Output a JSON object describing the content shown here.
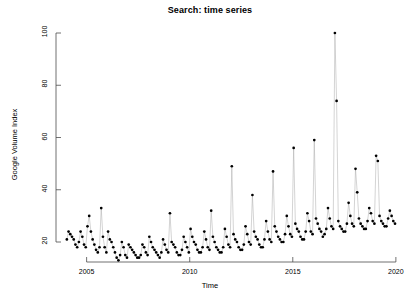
{
  "chart_data": {
    "type": "line",
    "title": "Search: time series",
    "xlabel": "Time",
    "ylabel": "Google Volume Index",
    "grid": false,
    "legend": null,
    "xlim": [
      2004.0,
      2020.0
    ],
    "ylim": [
      11,
      100
    ],
    "yticks": [
      20,
      40,
      60,
      80,
      100
    ],
    "xticks": [
      2005,
      2010,
      2015,
      2020
    ],
    "marker": "filled-circle",
    "marker_color": "#000000",
    "line_color": "#a9a9a9",
    "x": [
      2004.042,
      2004.125,
      2004.208,
      2004.292,
      2004.375,
      2004.458,
      2004.542,
      2004.625,
      2004.708,
      2004.792,
      2004.875,
      2004.958,
      2005.042,
      2005.125,
      2005.208,
      2005.292,
      2005.375,
      2005.458,
      2005.542,
      2005.625,
      2005.708,
      2005.792,
      2005.875,
      2005.958,
      2006.042,
      2006.125,
      2006.208,
      2006.292,
      2006.375,
      2006.458,
      2006.542,
      2006.625,
      2006.708,
      2006.792,
      2006.875,
      2006.958,
      2007.042,
      2007.125,
      2007.208,
      2007.292,
      2007.375,
      2007.458,
      2007.542,
      2007.625,
      2007.708,
      2007.792,
      2007.875,
      2007.958,
      2008.042,
      2008.125,
      2008.208,
      2008.292,
      2008.375,
      2008.458,
      2008.542,
      2008.625,
      2008.708,
      2008.792,
      2008.875,
      2008.958,
      2009.042,
      2009.125,
      2009.208,
      2009.292,
      2009.375,
      2009.458,
      2009.542,
      2009.625,
      2009.708,
      2009.792,
      2009.875,
      2009.958,
      2010.042,
      2010.125,
      2010.208,
      2010.292,
      2010.375,
      2010.458,
      2010.542,
      2010.625,
      2010.708,
      2010.792,
      2010.875,
      2010.958,
      2011.042,
      2011.125,
      2011.208,
      2011.292,
      2011.375,
      2011.458,
      2011.542,
      2011.625,
      2011.708,
      2011.792,
      2011.875,
      2011.958,
      2012.042,
      2012.125,
      2012.208,
      2012.292,
      2012.375,
      2012.458,
      2012.542,
      2012.625,
      2012.708,
      2012.792,
      2012.875,
      2012.958,
      2013.042,
      2013.125,
      2013.208,
      2013.292,
      2013.375,
      2013.458,
      2013.542,
      2013.625,
      2013.708,
      2013.792,
      2013.875,
      2013.958,
      2014.042,
      2014.125,
      2014.208,
      2014.292,
      2014.375,
      2014.458,
      2014.542,
      2014.625,
      2014.708,
      2014.792,
      2014.875,
      2014.958,
      2015.042,
      2015.125,
      2015.208,
      2015.292,
      2015.375,
      2015.458,
      2015.542,
      2015.625,
      2015.708,
      2015.792,
      2015.875,
      2015.958,
      2016.042,
      2016.125,
      2016.208,
      2016.292,
      2016.375,
      2016.458,
      2016.542,
      2016.625,
      2016.708,
      2016.792,
      2016.875,
      2016.958,
      2017.042,
      2017.125,
      2017.208,
      2017.292,
      2017.375,
      2017.458,
      2017.542,
      2017.625,
      2017.708,
      2017.792,
      2017.875,
      2017.958,
      2018.042,
      2018.125,
      2018.208,
      2018.292,
      2018.375,
      2018.458,
      2018.542,
      2018.625,
      2018.708,
      2018.792,
      2018.875,
      2018.958,
      2019.042,
      2019.125,
      2019.208,
      2019.292,
      2019.375,
      2019.458,
      2019.542,
      2019.625,
      2019.708,
      2019.792,
      2019.875,
      2019.958
    ],
    "values": [
      21,
      24,
      23,
      22,
      21,
      19,
      18,
      20,
      24,
      22,
      19,
      18,
      26,
      30,
      24,
      21,
      19,
      17,
      16,
      18,
      33,
      22,
      18,
      16,
      24,
      21,
      20,
      18,
      16,
      14,
      13,
      15,
      20,
      18,
      15,
      14,
      19,
      18,
      17,
      16,
      15,
      14,
      14,
      15,
      19,
      18,
      16,
      15,
      22,
      20,
      18,
      17,
      16,
      15,
      14,
      16,
      21,
      19,
      17,
      16,
      31,
      20,
      19,
      18,
      16,
      15,
      15,
      17,
      22,
      20,
      18,
      16,
      25,
      22,
      20,
      19,
      17,
      16,
      16,
      18,
      24,
      21,
      18,
      17,
      32,
      22,
      20,
      18,
      17,
      16,
      16,
      18,
      25,
      22,
      19,
      18,
      49,
      23,
      21,
      20,
      18,
      17,
      17,
      19,
      26,
      23,
      20,
      19,
      38,
      24,
      22,
      21,
      19,
      18,
      18,
      21,
      28,
      24,
      21,
      20,
      47,
      26,
      24,
      22,
      21,
      20,
      20,
      23,
      30,
      26,
      23,
      22,
      56,
      27,
      25,
      24,
      22,
      21,
      21,
      24,
      31,
      28,
      24,
      23,
      59,
      29,
      27,
      25,
      24,
      22,
      23,
      25,
      33,
      29,
      26,
      25,
      100,
      74,
      28,
      26,
      25,
      24,
      24,
      27,
      35,
      30,
      27,
      26,
      48,
      39,
      29,
      27,
      26,
      25,
      25,
      28,
      33,
      31,
      28,
      27,
      53,
      51,
      30,
      28,
      27,
      26,
      26,
      29,
      32,
      30,
      28,
      27
    ]
  },
  "axes": {
    "ytick_labels": [
      "20",
      "40",
      "60",
      "80",
      "100"
    ],
    "xtick_labels": [
      "2005",
      "2010",
      "2015",
      "2020"
    ]
  }
}
